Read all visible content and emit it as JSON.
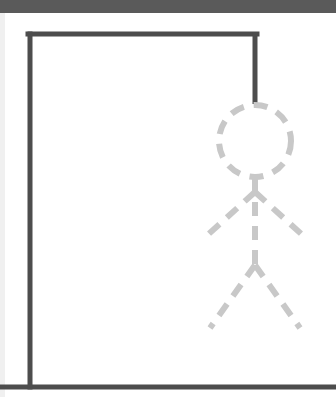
{
  "game": {
    "name": "hangman",
    "colors": {
      "top_bar": "#5a5a5a",
      "gallows": "#4d4d4d",
      "figure_dashed": "#c8c8c8",
      "background": "#ffffff"
    },
    "gallows": {
      "base": {
        "x1": 0,
        "y1": 387,
        "x2": 336,
        "y2": 387
      },
      "post": {
        "x1": 30,
        "y1": 387,
        "x2": 30,
        "y2": 34
      },
      "beam": {
        "x1": 28,
        "y1": 34,
        "x2": 257,
        "y2": 34
      },
      "rope": {
        "x1": 255,
        "y1": 32,
        "x2": 255,
        "y2": 104
      }
    },
    "figure": {
      "state": "outline-dashed",
      "head": {
        "cx": 255,
        "cy": 141,
        "r": 36
      },
      "body": {
        "x1": 255,
        "y1": 178,
        "x2": 255,
        "y2": 265
      },
      "left_arm": {
        "x1": 255,
        "y1": 192,
        "x2": 202,
        "y2": 240
      },
      "right_arm": {
        "x1": 255,
        "y1": 192,
        "x2": 308,
        "y2": 240
      },
      "left_leg": {
        "x1": 255,
        "y1": 265,
        "x2": 210,
        "y2": 328
      },
      "right_leg": {
        "x1": 255,
        "y1": 265,
        "x2": 300,
        "y2": 328
      }
    }
  }
}
